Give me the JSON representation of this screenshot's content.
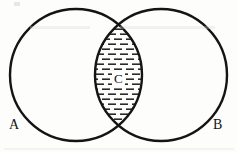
{
  "figure": {
    "type": "venn-diagram",
    "width": 237,
    "height": 152,
    "background_color": "#fdfdfc",
    "stroke_color": "#141414",
    "hatch_color": "#2b2b2b"
  },
  "sets": {
    "left": {
      "label": "A",
      "cx": 76,
      "cy": 75,
      "r": 66,
      "label_x": 9,
      "label_y": 118
    },
    "right": {
      "label": "B",
      "cx": 161,
      "cy": 75,
      "r": 66,
      "label_x": 213,
      "label_y": 118
    },
    "intersection": {
      "label": "C",
      "label_x": 112,
      "label_y": 71,
      "fill": "horizontal-dash-hatch",
      "top_point_x": 119,
      "top_point_y": 11,
      "bottom_point_x": 119,
      "bottom_point_y": 138,
      "left_edge_x": 84,
      "right_edge_x": 153
    }
  },
  "hatching": {
    "dash_width": 8,
    "dash_height": 1.6,
    "dash_gap": 4,
    "row_spacing": 5,
    "offset_pattern": "brick"
  }
}
